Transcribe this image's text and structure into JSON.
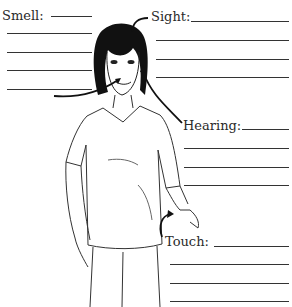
{
  "worksheet": {
    "senses": [
      {
        "key": "smell",
        "label": "Smell:"
      },
      {
        "key": "sight",
        "label": "Sight:"
      },
      {
        "key": "hearing",
        "label": "Hearing:"
      },
      {
        "key": "touch",
        "label": "Touch:"
      }
    ],
    "illustration": "person-outline-with-arrows"
  }
}
